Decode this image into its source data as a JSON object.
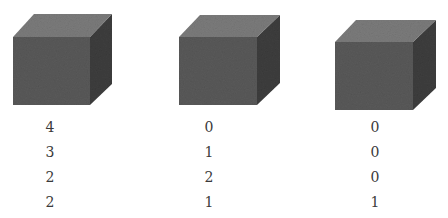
{
  "colors": {
    "front_face": "#5a5a5a",
    "top_face": "#7c7c7c",
    "side_face": "#3e3e3e",
    "text": "#3a3a3a"
  },
  "cubes": [
    {
      "label": "cube-1",
      "values": [
        "4",
        "3",
        "2",
        "2"
      ]
    },
    {
      "label": "cube-2",
      "values": [
        "0",
        "1",
        "2",
        "1"
      ]
    },
    {
      "label": "cube-3",
      "values": [
        "0",
        "0",
        "0",
        "1"
      ]
    }
  ]
}
